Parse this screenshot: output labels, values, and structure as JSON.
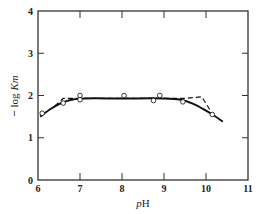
{
  "chart_data": {
    "type": "line",
    "title": "",
    "xlabel": "pH",
    "ylabel": "− log Km",
    "xlim": [
      6,
      11
    ],
    "ylim": [
      0,
      4
    ],
    "x_ticks": [
      6,
      7,
      8,
      9,
      10,
      11
    ],
    "y_ticks": [
      0,
      1,
      2,
      3,
      4
    ],
    "grid": false,
    "legend": null,
    "series": [
      {
        "name": "observed",
        "style": "open-circle markers",
        "points": [
          {
            "x": 6.1,
            "y": 1.58
          },
          {
            "x": 6.6,
            "y": 1.82
          },
          {
            "x": 7.0,
            "y": 2.0
          },
          {
            "x": 7.0,
            "y": 1.9
          },
          {
            "x": 8.05,
            "y": 2.0
          },
          {
            "x": 8.75,
            "y": 1.88
          },
          {
            "x": 8.9,
            "y": 2.0
          },
          {
            "x": 9.45,
            "y": 1.85
          },
          {
            "x": 10.15,
            "y": 1.55
          }
        ]
      },
      {
        "name": "fitted curve",
        "style": "solid line",
        "points": [
          {
            "x": 6.05,
            "y": 1.5
          },
          {
            "x": 6.3,
            "y": 1.68
          },
          {
            "x": 6.55,
            "y": 1.82
          },
          {
            "x": 6.8,
            "y": 1.9
          },
          {
            "x": 7.1,
            "y": 1.93
          },
          {
            "x": 8.0,
            "y": 1.93
          },
          {
            "x": 9.0,
            "y": 1.93
          },
          {
            "x": 9.4,
            "y": 1.9
          },
          {
            "x": 9.7,
            "y": 1.8
          },
          {
            "x": 10.0,
            "y": 1.64
          },
          {
            "x": 10.2,
            "y": 1.52
          },
          {
            "x": 10.4,
            "y": 1.38
          }
        ]
      },
      {
        "name": "asymptotes",
        "style": "dashed line",
        "points": [
          {
            "x": 6.4,
            "y": 1.75
          },
          {
            "x": 6.6,
            "y": 1.93
          },
          {
            "x": 9.5,
            "y": 1.93
          },
          {
            "x": 9.9,
            "y": 1.97
          },
          {
            "x": 10.1,
            "y": 1.65
          }
        ]
      }
    ]
  },
  "axes": {
    "x_label_prefix": "p",
    "x_label_suffix": "H",
    "y_label_sign": "−",
    "y_label_log": "log",
    "y_label_var": "Km"
  }
}
